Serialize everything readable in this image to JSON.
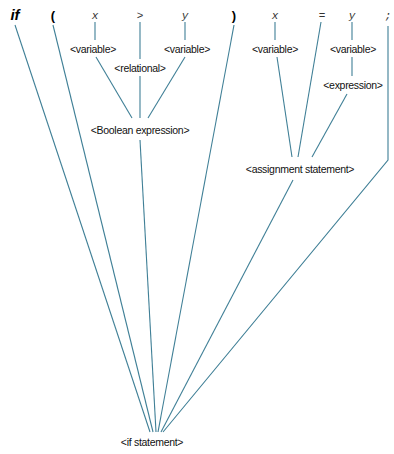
{
  "diagram": {
    "type": "parse-tree",
    "line_color": "#3f7f96",
    "terminals": [
      {
        "id": "t_if",
        "label": "if",
        "style": "keyword"
      },
      {
        "id": "t_lparen",
        "label": "(",
        "style": "paren"
      },
      {
        "id": "t_x1",
        "label": "x",
        "style": "token"
      },
      {
        "id": "t_gt",
        "label": ">",
        "style": "token"
      },
      {
        "id": "t_y1",
        "label": "y",
        "style": "token"
      },
      {
        "id": "t_rparen",
        "label": ")",
        "style": "paren"
      },
      {
        "id": "t_x2",
        "label": "x",
        "style": "token"
      },
      {
        "id": "t_eq",
        "label": "=",
        "style": "token"
      },
      {
        "id": "t_y2",
        "label": "y",
        "style": "token"
      },
      {
        "id": "t_semi",
        "label": ";",
        "style": "token"
      }
    ],
    "nonterminals": {
      "var_x1": "<variable>",
      "relational": "<relational>",
      "var_y1": "<variable>",
      "bool_expr": "<Boolean expression>",
      "var_x2": "<variable>",
      "var_y2": "<variable>",
      "expression": "<expression>",
      "assignment": "<assignment statement>",
      "root": "<if statement>"
    },
    "edges": [
      [
        "t_x1",
        "var_x1"
      ],
      [
        "t_gt",
        "relational"
      ],
      [
        "t_y1",
        "var_y1"
      ],
      [
        "var_x1",
        "bool_expr"
      ],
      [
        "relational",
        "bool_expr"
      ],
      [
        "var_y1",
        "bool_expr"
      ],
      [
        "t_x2",
        "var_x2"
      ],
      [
        "t_y2",
        "var_y2"
      ],
      [
        "var_y2",
        "expression"
      ],
      [
        "var_x2",
        "assignment"
      ],
      [
        "t_eq",
        "assignment"
      ],
      [
        "expression",
        "assignment"
      ],
      [
        "t_if",
        "root"
      ],
      [
        "t_lparen",
        "root"
      ],
      [
        "bool_expr",
        "root"
      ],
      [
        "t_rparen",
        "root"
      ],
      [
        "assignment",
        "root"
      ],
      [
        "t_semi",
        "root"
      ]
    ]
  }
}
